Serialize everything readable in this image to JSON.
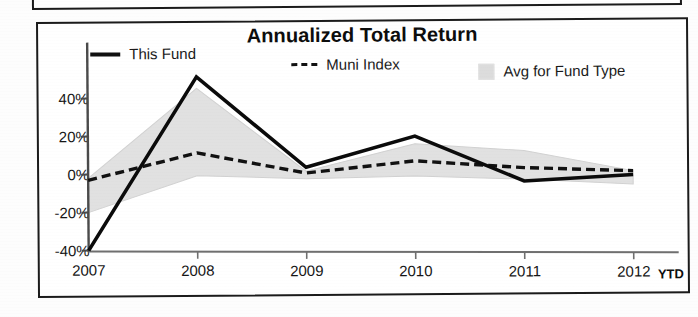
{
  "chart": {
    "title": "Annualized Total Return",
    "legend": [
      {
        "label": "This Fund",
        "style": "solid-line",
        "color": "#111111"
      },
      {
        "label": "Muni Index",
        "style": "dashed-line",
        "color": "#111111"
      },
      {
        "label": "Avg for Fund Type",
        "style": "filled-band",
        "color": "#dcdcdc"
      }
    ],
    "ytd_note": "YTD"
  },
  "chart_data": {
    "type": "line",
    "title": "Annualized Total Return",
    "xlabel": "",
    "ylabel": "",
    "categories": [
      "2007",
      "2008",
      "2009",
      "2010",
      "2011",
      "2012"
    ],
    "x_tick_labels": [
      "2007",
      "2008",
      "2009",
      "2010",
      "2011",
      "2012"
    ],
    "y_tick_labels": [
      "40%",
      "20%",
      "0%",
      "-20%",
      "-40%"
    ],
    "y_ticks": [
      40,
      20,
      0,
      -20,
      -40
    ],
    "ylim": [
      -42,
      56
    ],
    "grid": false,
    "legend_position": "top",
    "units": "percent",
    "series": [
      {
        "name": "This Fund",
        "style": "solid",
        "values": [
          -40,
          51,
          3,
          19,
          -5,
          -2
        ]
      },
      {
        "name": "Muni Index",
        "style": "dashed",
        "values": [
          -3,
          11,
          0,
          6,
          2,
          0
        ]
      },
      {
        "name": "Avg for Fund Type",
        "style": "band",
        "upper": [
          -2,
          45,
          1,
          15,
          11,
          0
        ],
        "lower": [
          -20,
          -1,
          -3,
          -2,
          -4,
          -7
        ]
      }
    ],
    "annotations": [
      "YTD"
    ]
  }
}
